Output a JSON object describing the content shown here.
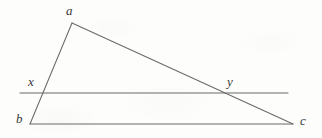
{
  "figure": {
    "kind": "geometry-diagram",
    "background_color": "#fdfdfc",
    "stroke_color": "#6a6a6a",
    "label_color": "#3a3a3a",
    "stroke_width": 1,
    "width": 322,
    "height": 138,
    "points": [
      {
        "id": "a",
        "label": "a",
        "x": 72,
        "y": 23,
        "label_x": 66,
        "label_y": 4
      },
      {
        "id": "b",
        "label": "b",
        "x": 30,
        "y": 124,
        "label_x": 16,
        "label_y": 112
      },
      {
        "id": "c",
        "label": "c",
        "x": 293,
        "y": 124,
        "label_x": 300,
        "label_y": 114
      },
      {
        "id": "x",
        "label": "x",
        "x": 43,
        "y": 93,
        "label_x": 28,
        "label_y": 75
      },
      {
        "id": "y",
        "label": "y",
        "x": 226,
        "y": 93,
        "label_x": 227,
        "label_y": 75
      }
    ],
    "segments": [
      {
        "id": "side-ab",
        "name": "segment-a-b",
        "from": "a",
        "x1": 72,
        "y1": 23,
        "x2": 30,
        "y2": 124
      },
      {
        "id": "side-ac",
        "name": "segment-a-c",
        "from": "a",
        "x1": 72,
        "y1": 23,
        "x2": 293,
        "y2": 124
      },
      {
        "id": "base-bc",
        "name": "segment-b-c",
        "from": "b",
        "x1": 30,
        "y1": 124,
        "x2": 293,
        "y2": 124
      },
      {
        "id": "transversal-xy",
        "name": "segment-x-y-horizontal",
        "from": "x",
        "x1": 20,
        "y1": 93,
        "x2": 288,
        "y2": 93
      }
    ]
  }
}
